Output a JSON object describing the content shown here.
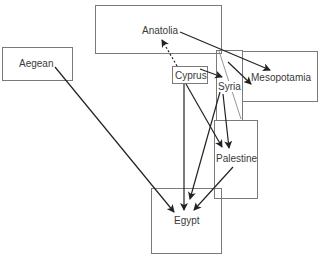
{
  "diagram": {
    "type": "flow-map",
    "regions": [
      {
        "id": "aegean",
        "label": "Aegean"
      },
      {
        "id": "anatolia",
        "label": "Anatolia"
      },
      {
        "id": "cyprus",
        "label": "Cyprus"
      },
      {
        "id": "syria",
        "label": "Syria"
      },
      {
        "id": "mesopotamia",
        "label": "Mesopotamia"
      },
      {
        "id": "palestine",
        "label": "Palestine"
      },
      {
        "id": "egypt",
        "label": "Egypt"
      }
    ],
    "edges": [
      {
        "from": "aegean",
        "to": "egypt",
        "style": "solid"
      },
      {
        "from": "anatolia",
        "to": "mesopotamia",
        "style": "solid"
      },
      {
        "from": "cyprus",
        "to": "anatolia",
        "style": "dashed"
      },
      {
        "from": "cyprus",
        "to": "syria",
        "style": "solid"
      },
      {
        "from": "cyprus",
        "to": "egypt",
        "style": "solid"
      },
      {
        "from": "cyprus",
        "to": "palestine",
        "style": "solid"
      },
      {
        "from": "syria",
        "to": "mesopotamia",
        "style": "solid"
      },
      {
        "from": "syria",
        "to": "palestine",
        "style": "solid"
      },
      {
        "from": "syria",
        "to": "egypt",
        "style": "solid"
      },
      {
        "from": "palestine",
        "to": "egypt",
        "style": "solid"
      }
    ]
  }
}
